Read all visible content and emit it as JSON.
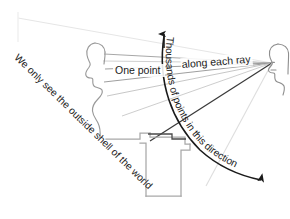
{
  "figure": {
    "title": "We only see the outside shell of the world",
    "background_color": "#ffffff",
    "width": 290,
    "height": 219
  },
  "labels": {
    "one_point": "One point",
    "along_each_ray": "along each ray",
    "thousands_curve": "Thousands of points in this direction",
    "shell_note": "We only see the outside shell of the world"
  },
  "colors": {
    "ink_dark": "#1a1a1a",
    "ray_mid": "#8f8f8f",
    "ray_light": "#c9c9c9",
    "ray_faint": "#e2e2e2",
    "outline_gray": "#a8a8a8",
    "head_gray": "#9a9a9a"
  },
  "elements": {
    "left_head_label": "head-profile-left",
    "right_head_label": "head-profile-right",
    "up_arrow_label": "up-arrow",
    "curved_arrow_label": "curved-arrow-down",
    "block_label": "occluding-block-shape",
    "rays_label": "sight-ray-fan"
  },
  "ray_fan": {
    "origin": {
      "x": 272,
      "y": 63
    },
    "count": 9,
    "endpoints": [
      {
        "x": 18,
        "y": 18,
        "shade": "faint"
      },
      {
        "x": 104,
        "y": 55,
        "shade": "mid"
      },
      {
        "x": 103,
        "y": 62,
        "shade": "light"
      },
      {
        "x": 106,
        "y": 70,
        "shade": "mid"
      },
      {
        "x": 104,
        "y": 82,
        "shade": "mid"
      },
      {
        "x": 106,
        "y": 96,
        "shade": "light"
      },
      {
        "x": 120,
        "y": 115,
        "shade": "light"
      },
      {
        "x": 150,
        "y": 140,
        "shade": "dark"
      },
      {
        "x": 205,
        "y": 185,
        "shade": "faint"
      }
    ]
  },
  "curved_arrow": {
    "start": {
      "x": 164,
      "y": 32
    },
    "end": {
      "x": 264,
      "y": 182
    },
    "direction": "up-and-down-arc",
    "arrowheads": [
      "top",
      "bottom"
    ]
  },
  "block_shape": {
    "name": "staircase-block",
    "stroke": "#a8a8a8"
  }
}
